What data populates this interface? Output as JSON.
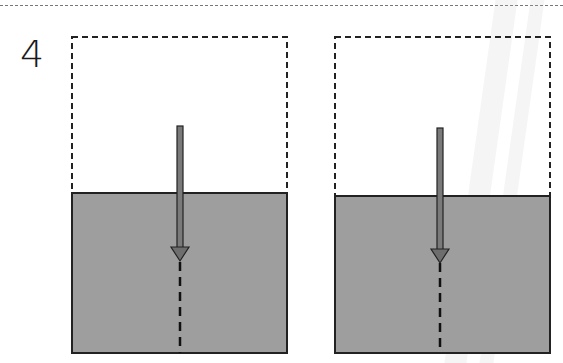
{
  "figure": {
    "number_label": "4",
    "colors": {
      "water": "#9e9e9e",
      "outline": "#222222",
      "arrow_fill": "#7a7a7a",
      "dashed_border": "#222222"
    },
    "panels": [
      {
        "id": "left",
        "container": {
          "x": 72,
          "y": 37,
          "width": 215,
          "height": 316
        },
        "water_top_y": 193,
        "arrow": {
          "x": 180,
          "top_y": 126,
          "head_tip_y": 260
        },
        "extension_dashed_to_y": 353
      },
      {
        "id": "right",
        "container": {
          "x": 335,
          "y": 37,
          "width": 215,
          "height": 316
        },
        "water_top_y": 196,
        "arrow": {
          "x": 440,
          "top_y": 128,
          "head_tip_y": 262
        },
        "extension_dashed_to_y": 353
      }
    ]
  }
}
